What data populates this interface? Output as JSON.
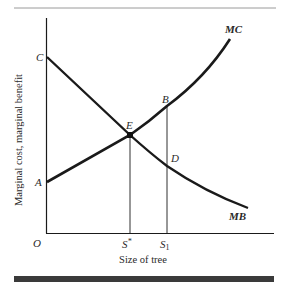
{
  "figure": {
    "title_partial": "",
    "y_axis_label": "Marginal cost, marginal benefit",
    "x_axis_label": "Size of tree",
    "origin_label": "O",
    "points": {
      "A": "A",
      "B": "B",
      "C": "C",
      "D": "D",
      "E": "E"
    },
    "x_ticks": {
      "s_star": "S",
      "s_star_sup": "*",
      "s1": "S",
      "s1_sub": "1"
    },
    "curves": {
      "mc": "MC",
      "mb": "MB"
    },
    "colors": {
      "line": "#1a1a1a",
      "bar": "#3a3a3a",
      "rule": "#9a9a9a"
    }
  }
}
